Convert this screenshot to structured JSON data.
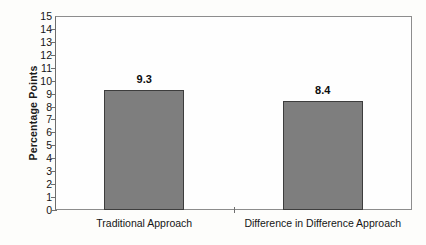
{
  "chart_data": {
    "type": "bar",
    "title": "",
    "xlabel": "",
    "ylabel": "Percentage Points",
    "categories": [
      "Traditional Approach",
      "Difference in Difference Approach"
    ],
    "values": [
      9.3,
      8.4
    ],
    "value_labels": [
      "9.3",
      "8.4"
    ],
    "ylim": [
      0,
      15
    ],
    "ytick_step": 1,
    "yticks": [
      "15",
      "14",
      "13",
      "12",
      "11",
      "10",
      "9",
      "8",
      "7",
      "6",
      "5",
      "4",
      "3",
      "2",
      "1",
      "0"
    ],
    "grid": false,
    "legend": false,
    "legend_position": "none",
    "bar_fill_color": "#7e7e7e",
    "bar_border_color": "#3d3d3d",
    "axis_color": "#8d8d8d",
    "text_color": "#131313",
    "background_color": "#fdfdfb"
  }
}
